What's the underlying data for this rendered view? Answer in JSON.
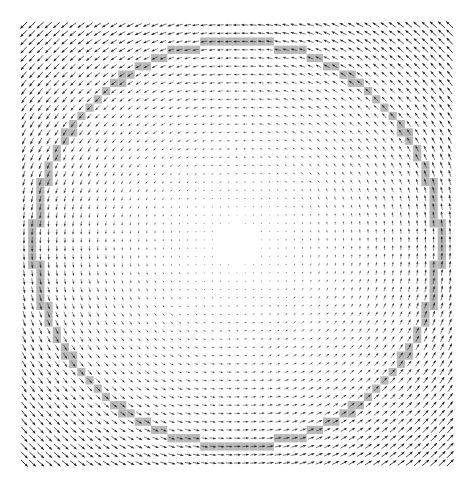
{
  "chart_data": {
    "type": "quiver",
    "title": "",
    "xlabel": "",
    "ylabel": "",
    "axes_visible": false,
    "grid": false,
    "legend": null,
    "field": {
      "description": "Rotational (counter-clockwise) vector field; vector magnitude grows linearly with distance from center; near-zero at center",
      "u_formula": "-(y - cy)",
      "v_formula": "(x - cx)",
      "grid_cols": 53,
      "grid_rows": 54,
      "x_range_px": [
        24,
        450
      ],
      "y_range_px": [
        25,
        463
      ],
      "spacing_px": 8.15,
      "center_px": [
        237,
        244
      ]
    },
    "highlight": {
      "shape": "circle-of-cells",
      "description": "Grid cells lying on a circle are drawn with a gray background band",
      "radius_px": 202,
      "band_width_px": 8,
      "color": "#b9b9b9"
    },
    "colors": {
      "arrow": "#1a1a1a",
      "highlight": "#b9b9b9",
      "background": "#ffffff"
    }
  }
}
